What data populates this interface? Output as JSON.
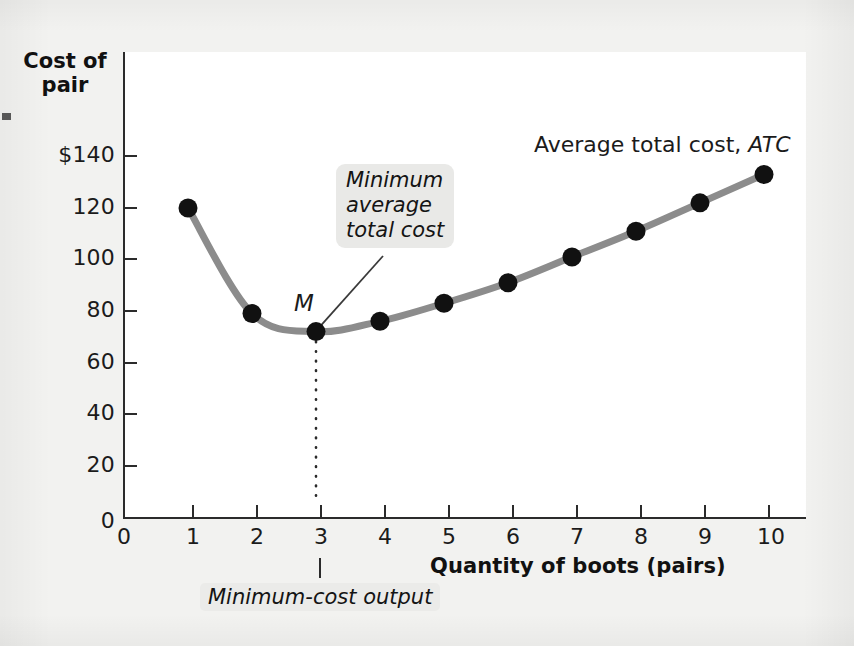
{
  "axes": {
    "y_title": "Cost of\npair",
    "x_title": "Quantity of boots (pairs)"
  },
  "labels": {
    "series": "Average total cost, ",
    "series_italic": "ATC",
    "minimum_point": "M",
    "callout": "Minimum\naverage\ntotal cost",
    "bottom_caption": "Minimum-cost output"
  },
  "colors": {
    "curve": "#8c8c8c",
    "point": "#111111",
    "axis": "#2b2b2b",
    "callout_bg": "#e9e9e7",
    "plot_bg": "#ffffff",
    "page_bg": "#f2f2f0"
  },
  "chart_data": {
    "type": "line",
    "title": "",
    "xlabel": "Quantity of boots (pairs)",
    "ylabel": "Cost of pair",
    "xlim": [
      0,
      10.6
    ],
    "ylim": [
      0,
      150
    ],
    "grid": false,
    "legend": "Average total cost, ATC",
    "y_ticks": [
      {
        "value": 140,
        "label": "$140"
      },
      {
        "value": 120,
        "label": "120"
      },
      {
        "value": 100,
        "label": "100"
      },
      {
        "value": 80,
        "label": "80"
      },
      {
        "value": 60,
        "label": "60"
      },
      {
        "value": 40,
        "label": "40"
      },
      {
        "value": 20,
        "label": "20"
      },
      {
        "value": 0,
        "label": "0"
      }
    ],
    "x_ticks": [
      {
        "value": 0,
        "label": "0"
      },
      {
        "value": 1,
        "label": "1"
      },
      {
        "value": 2,
        "label": "2"
      },
      {
        "value": 3,
        "label": "3"
      },
      {
        "value": 4,
        "label": "4"
      },
      {
        "value": 5,
        "label": "5"
      },
      {
        "value": 6,
        "label": "6"
      },
      {
        "value": 7,
        "label": "7"
      },
      {
        "value": 8,
        "label": "8"
      },
      {
        "value": 9,
        "label": "9"
      },
      {
        "value": 10,
        "label": "10"
      }
    ],
    "series": [
      {
        "name": "Average total cost, ATC",
        "x": [
          1,
          2,
          3,
          4,
          5,
          6,
          7,
          8,
          9,
          10
        ],
        "values": [
          120,
          79,
          72,
          76,
          83,
          91,
          101,
          111,
          122,
          133
        ]
      }
    ],
    "annotations": [
      {
        "name": "minimum-point",
        "label": "M",
        "x": 3,
        "y": 72
      },
      {
        "name": "callout",
        "text": "Minimum average total cost",
        "points_to": {
          "x": 3,
          "y": 72
        }
      },
      {
        "name": "dotted-dropline",
        "from": {
          "x": 3,
          "y": 72
        },
        "to": {
          "x": 3,
          "y": 0
        }
      },
      {
        "name": "bottom-caption",
        "text": "Minimum-cost output",
        "x": 3
      }
    ]
  }
}
